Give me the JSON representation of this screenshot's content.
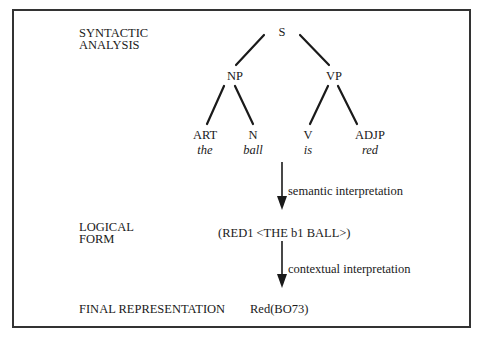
{
  "levels": {
    "syntactic": {
      "label_line1": "SYNTACTIC",
      "label_line2": "ANALYSIS"
    },
    "logical": {
      "label_line1": "LOGICAL",
      "label_line2": "FORM",
      "expression": "(RED1 <THE b1 BALL>)"
    },
    "final": {
      "label": "FINAL REPRESENTATION",
      "expression": "Red(BO73)"
    }
  },
  "tree": {
    "root": "S",
    "np": "NP",
    "vp": "VP",
    "leaves": [
      {
        "category": "ART",
        "word": "the"
      },
      {
        "category": "N",
        "word": "ball"
      },
      {
        "category": "V",
        "word": "is"
      },
      {
        "category": "ADJP",
        "word": "red"
      }
    ]
  },
  "arrows": [
    {
      "label": "semantic interpretation"
    },
    {
      "label": "contextual interpretation"
    }
  ],
  "colors": {
    "ink": "#1a1a1a",
    "border": "#333333",
    "background": "#ffffff"
  }
}
